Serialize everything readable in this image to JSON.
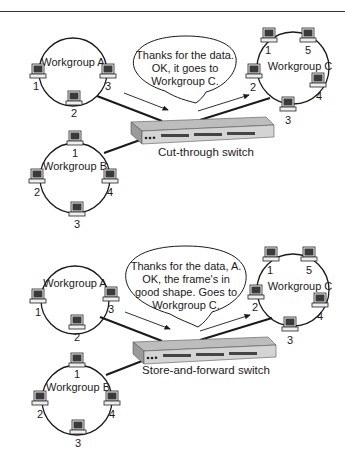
{
  "panels": [
    {
      "id": "cut-through",
      "switch_label": "Cut-through switch",
      "bubble": [
        "Thanks for the data.",
        "OK, it goes to",
        "Workgroup C."
      ],
      "workgroups": {
        "a": {
          "label": "Workgroup A",
          "nodes": [
            "1",
            "2",
            "3"
          ]
        },
        "b": {
          "label": "Workgroup B",
          "nodes": [
            "1",
            "2",
            "3",
            "4"
          ]
        },
        "c": {
          "label": "Workgroup C",
          "nodes": [
            "1",
            "2",
            "3",
            "4",
            "5"
          ]
        }
      }
    },
    {
      "id": "store-and-forward",
      "switch_label": "Store-and-forward switch",
      "bubble": [
        "Thanks for the data, A.",
        "OK, the frame's in",
        "good shape. Goes to",
        "Workgroup C."
      ],
      "workgroups": {
        "a": {
          "label": "Workgroup A",
          "nodes": [
            "1",
            "2",
            "3"
          ]
        },
        "b": {
          "label": "Workgroup B",
          "nodes": [
            "1",
            "2",
            "3",
            "4"
          ]
        },
        "c": {
          "label": "Workgroup C",
          "nodes": [
            "1",
            "2",
            "3",
            "4",
            "5"
          ]
        }
      }
    }
  ],
  "icons": {
    "computer": "computer-icon",
    "switch": "network-switch-icon",
    "arrow": "arrow-icon"
  },
  "colors": {
    "line": "#1a1a1a",
    "screen": "#333333",
    "switch_top": "#bdbdbd",
    "switch_front": "#d4d4d4"
  }
}
